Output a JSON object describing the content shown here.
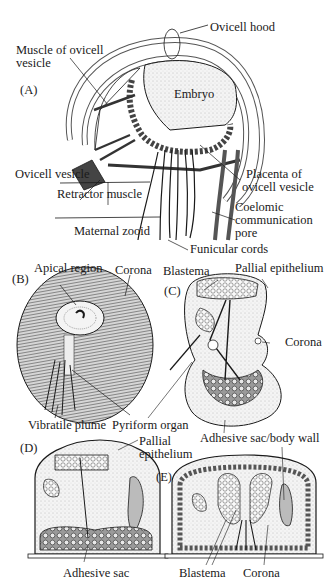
{
  "figure": {
    "panels": [
      {
        "id": "A",
        "label": "(A)"
      },
      {
        "id": "B",
        "label": "(B)"
      },
      {
        "id": "C",
        "label": "(C)"
      },
      {
        "id": "D",
        "label": "(D)"
      },
      {
        "id": "E",
        "label": "(E)"
      }
    ],
    "labels": {
      "A": {
        "ovicell_hood": "Ovicell hood",
        "muscle_line1": "Muscle of ovicell",
        "muscle_line2": "vesicle",
        "embryo": "Embryo",
        "ovicell_vesicle": "Ovicell vesicle",
        "retractor_muscle": "Retractor muscle",
        "placenta_line1": "Placenta of",
        "placenta_line2": "ovicell vesicle",
        "coelomic_line1": "Coelomic",
        "coelomic_line2": "communication",
        "coelomic_line3": "pore",
        "maternal_zooid": "Maternal zooid",
        "funicular_cords": "Funicular cords"
      },
      "B": {
        "apical_region": "Apical region",
        "corona": "Corona",
        "vibratile_plume": "Vibratile plume",
        "pyriform_organ": "Pyriform organ"
      },
      "C": {
        "blastema": "Blastema",
        "pallial_epithelium": "Pallial epithelium",
        "corona": "Corona",
        "adhesive_sac_body_wall": "Adhesive sac/body wall"
      },
      "D": {
        "pallial_line1": "Pallial",
        "pallial_line2": "epithelium",
        "adhesive_sac": "Adhesive sac"
      },
      "E": {
        "blastema": "Blastema",
        "corona": "Corona"
      }
    },
    "colors": {
      "ink": "#1a1a1a",
      "stipple": "#e8e8e8",
      "background": "#ffffff"
    }
  }
}
